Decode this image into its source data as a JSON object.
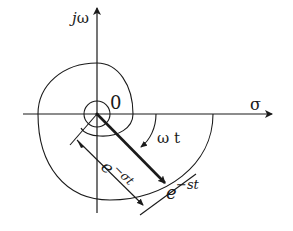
{
  "diagram": {
    "type": "complex-plane spiral",
    "axes": {
      "vertical_label_j": "j",
      "vertical_label_omega": "ω",
      "horizontal_label": "σ"
    },
    "origin_label": "0",
    "angle_label": "ω t",
    "magnitude_label_base": "e",
    "magnitude_label_exp": "−σt",
    "vector_label_base": "e",
    "vector_label_exp": "−st",
    "colors": {
      "ink": "#1a1a1a",
      "background": "#ffffff"
    }
  }
}
